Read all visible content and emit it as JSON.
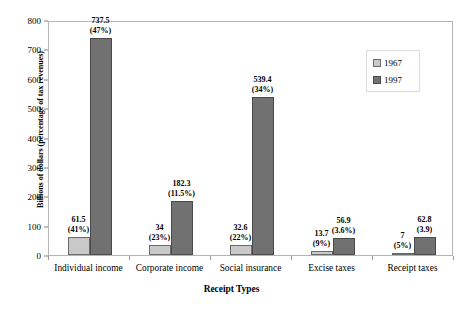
{
  "chart_data": {
    "type": "bar",
    "title": "",
    "xlabel": "Receipt Types",
    "ylabel": "Billions of dollars (percentage of tax revenues)",
    "ylim": [
      0,
      800
    ],
    "ytick_labels": [
      "0",
      "100",
      "200",
      "300",
      "400",
      "500",
      "600",
      "700",
      "800"
    ],
    "ytick_values": [
      0,
      100,
      200,
      300,
      400,
      500,
      600,
      700,
      800
    ],
    "grid": false,
    "legend_position": "upper right",
    "categories": [
      "Individual income",
      "Corporate income",
      "Social insurance",
      "Excise taxes",
      "Receipt taxes"
    ],
    "series": [
      {
        "name": "1967",
        "color": "#c9c9c9",
        "values": [
          61.5,
          34,
          32.6,
          13.7,
          7
        ],
        "data_labels": [
          "61.5\n(41%)",
          "34\n(23%)",
          "32.6\n(22%)",
          "13.7\n(9%)",
          "7\n(5%)"
        ],
        "value_labels": [
          "61.5",
          "34",
          "32.6",
          "13.7",
          "7"
        ],
        "percent_labels": [
          "(41%)",
          "(23%)",
          "(22%)",
          "(9%)",
          "(5%)"
        ]
      },
      {
        "name": "1997",
        "color": "#717171",
        "values": [
          737.5,
          182.3,
          539.4,
          56.9,
          62.8
        ],
        "data_labels": [
          "737.5\n(47%)",
          "182.3\n(11.5%)",
          "539.4\n(34%)",
          "56.9\n(3.6%)",
          "62.8\n(3.9)"
        ],
        "value_labels": [
          "737.5",
          "182.3",
          "539.4",
          "56.9",
          "62.8"
        ],
        "percent_labels": [
          "(47%)",
          "(11.5%)",
          "(34%)",
          "(3.6%)",
          "(3.9)"
        ]
      }
    ]
  },
  "legend": {
    "entries": [
      {
        "label": "1967"
      },
      {
        "label": "1997"
      }
    ]
  }
}
